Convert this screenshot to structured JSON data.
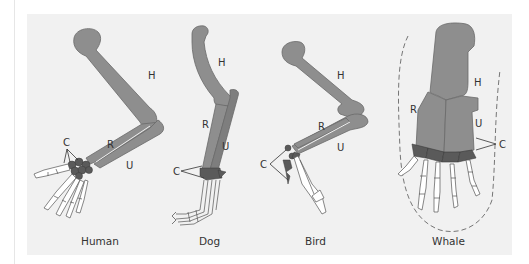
{
  "figure": {
    "colors": {
      "background": "#f1f1f1",
      "bone": "#8e8e8e",
      "bone_outline": "#6a6a6a",
      "carpals": "#5a5a5a",
      "digits_fill": "#ffffff",
      "digits_outline": "#555555",
      "text": "#333333"
    },
    "bone_labels": {
      "humerus": "H",
      "radius": "R",
      "ulna": "U",
      "carpals": "C"
    },
    "panels": [
      {
        "name": "human",
        "caption": "Human",
        "labels": {
          "H": "H",
          "R": "R",
          "U": "U",
          "C": "C"
        }
      },
      {
        "name": "dog",
        "caption": "Dog",
        "labels": {
          "H": "H",
          "R": "R",
          "U": "U",
          "C": "C"
        }
      },
      {
        "name": "bird",
        "caption": "Bird",
        "labels": {
          "H": "H",
          "R": "R",
          "U": "U",
          "C": "C"
        }
      },
      {
        "name": "whale",
        "caption": "Whale",
        "labels": {
          "H": "H",
          "R": "R",
          "U": "U",
          "C": "C"
        }
      }
    ]
  }
}
